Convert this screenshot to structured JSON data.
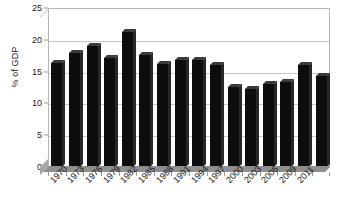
{
  "chart_data": {
    "type": "bar",
    "title": "",
    "subtitle": "",
    "xlabel": "",
    "ylabel": "% of GDP",
    "ylim": [
      0,
      25
    ],
    "ytick_interval": 5,
    "yticks": [
      0,
      5,
      10,
      15,
      20,
      25
    ],
    "ytick_labels": [
      "0",
      "5",
      "10",
      "15",
      "20",
      "25"
    ],
    "grid": true,
    "grid_axis": "y",
    "legend": false,
    "legend_position": "none",
    "bar_color": "#0d0d0d",
    "gridline_color": "#c8c8c8",
    "plot_border_color": "#b6b6b6",
    "categories": [
      "1970",
      "1973",
      "1976",
      "1979",
      "1982",
      "1985",
      "1988",
      "1991",
      "1994",
      "1997",
      "2000",
      "2003",
      "2006",
      "2009",
      "2011",
      ""
    ],
    "xtick_labels": [
      "1970",
      "1973",
      "1976",
      "1979",
      "1982",
      "1985",
      "1988",
      "1991",
      "1994",
      "1997",
      "2000",
      "2003",
      "2006",
      "2009",
      "2011"
    ],
    "values": [
      16.3,
      18.0,
      19.0,
      17.1,
      21.2,
      17.6,
      16.2,
      16.8,
      16.9,
      16.0,
      12.6,
      12.3,
      13.0,
      13.3,
      16.1,
      14.3
    ],
    "annotations": []
  }
}
